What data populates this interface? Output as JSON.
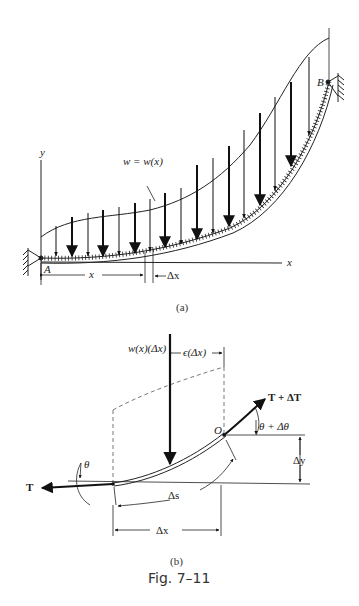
{
  "figure": {
    "caption": "Fig. 7–11",
    "part_a": {
      "sublabel": "(a)",
      "axis_y": "y",
      "axis_x": "x",
      "load_label": "w = w(x)",
      "point_a": "A",
      "point_b": "B",
      "dim_x": "x",
      "dim_dx": "Δx"
    },
    "part_b": {
      "sublabel": "(b)",
      "load_label": "w(x)(Δx)",
      "offset_label": "ϵ(Δx)",
      "tension_right": "T + ΔT",
      "tension_left": "T",
      "angle_right": "θ + Δθ",
      "angle_left": "θ",
      "point_o": "O",
      "dim_dy": "Δy",
      "dim_ds": "Δs",
      "dim_dx": "Δx"
    }
  }
}
